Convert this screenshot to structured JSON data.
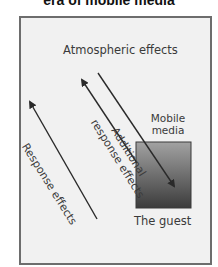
{
  "title": "era of mobile media",
  "diagram": {
    "nodes": {
      "mobile_media": "Mobile media",
      "mobile_media_line1": "Mobile",
      "mobile_media_line2": "media",
      "guest": "The guest"
    },
    "arrows": [
      {
        "label": "Atmospheric effects",
        "direction": "toward mobile media / guest"
      },
      {
        "label": "Additional response effects",
        "label_line1": "Additional",
        "label_line2": "response effects",
        "direction": "away from guest"
      },
      {
        "label": "Response effects",
        "direction": "away from guest"
      }
    ]
  },
  "colors": {
    "frame_border": "#6d6d6d",
    "frame_fill": "#f1f1f1",
    "box_top": "#9a9a9a",
    "box_bottom": "#404040",
    "arrow": "#2a2a2a",
    "text": "#3a3a3a"
  }
}
